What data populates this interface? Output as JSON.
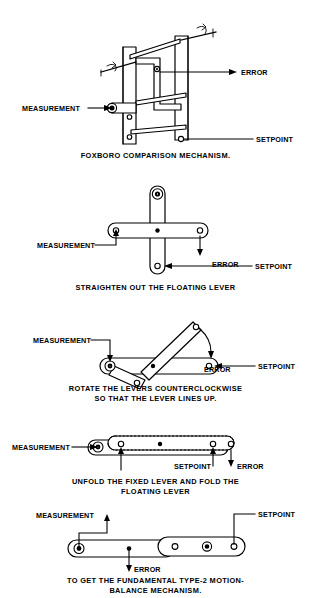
{
  "figure": {
    "ink_color": "#000000",
    "background_color": "#ffffff"
  },
  "labels": {
    "measurement": "MEASUREMENT",
    "error": "ERROR",
    "setpoint": "SETPOINT"
  },
  "panels": [
    {
      "id": "panel-foxboro",
      "caption_lines": [
        "FOXBORO COMPARISON MECHANISM."
      ],
      "annotations": [
        {
          "name": "measurement",
          "text": "MEASUREMENT"
        },
        {
          "name": "error",
          "text": "ERROR"
        },
        {
          "name": "setpoint",
          "text": "SETPOINT"
        }
      ]
    },
    {
      "id": "panel-straighten",
      "caption_lines": [
        "STRAIGHTEN OUT THE FLOATING LEVER"
      ],
      "annotations": [
        {
          "name": "measurement",
          "text": "MEASUREMENT"
        },
        {
          "name": "error",
          "text": "ERROR"
        },
        {
          "name": "setpoint",
          "text": "SETPOINT"
        }
      ]
    },
    {
      "id": "panel-rotate",
      "caption_lines": [
        "ROTATE  THE  LEVERS  COUNTERCLOCKWISE",
        "SO THAT THE LEVER LINES UP."
      ],
      "annotations": [
        {
          "name": "measurement",
          "text": "MEASUREMENT"
        },
        {
          "name": "error",
          "text": "ERROR"
        },
        {
          "name": "setpoint",
          "text": "SETPOINT"
        }
      ]
    },
    {
      "id": "panel-unfold",
      "caption_lines": [
        "UNFOLD THE FIXED LEVER AND FOLD THE",
        "FLOATING LEVER"
      ],
      "annotations": [
        {
          "name": "measurement",
          "text": "MEASUREMENT"
        },
        {
          "name": "setpoint",
          "text": "SETPOINT"
        },
        {
          "name": "error",
          "text": "ERROR"
        }
      ]
    },
    {
      "id": "panel-final",
      "caption_lines": [
        "TO GET THE FUNDAMENTAL TYPE-2 MOTION-",
        "BALANCE  MECHANISM."
      ],
      "annotations": [
        {
          "name": "measurement",
          "text": "MEASUREMENT"
        },
        {
          "name": "setpoint",
          "text": "SETPOINT"
        },
        {
          "name": "error",
          "text": "ERROR"
        }
      ]
    }
  ]
}
